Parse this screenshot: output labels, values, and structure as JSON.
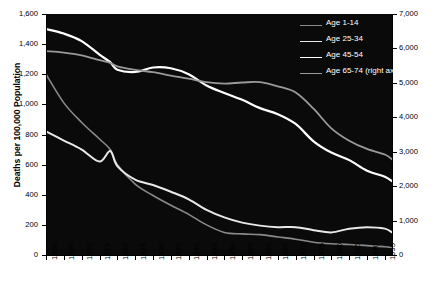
{
  "chart_data": {
    "type": "line",
    "title": "",
    "subtitle": "",
    "xlabel": "",
    "ylabel": "Deaths per 100,000 Population",
    "ylabel_right": "Deaths per 100,000 Population (age 65-74)",
    "xlim": [
      1900,
      1997
    ],
    "ylim": [
      0,
      1600
    ],
    "ylim_right": [
      0,
      7000
    ],
    "grid": false,
    "legend_position": "top-right",
    "plot_background": "#0a0a0a",
    "x_ticks": [
      "1900",
      "1905",
      "1910",
      "1915",
      "1920",
      "1925",
      "1930",
      "1935",
      "1940",
      "1945",
      "1950",
      "1955",
      "1960",
      "1965",
      "1970",
      "1975",
      "1980",
      "1985",
      "1990",
      "1995"
    ],
    "y_ticks_left": [
      "0",
      "200",
      "400",
      "600",
      "800",
      "1,000",
      "1,200",
      "1,400",
      "1,600"
    ],
    "y_ticks_right": [
      "0",
      "1,000",
      "2,000",
      "3,000",
      "4,000",
      "5,000",
      "6,000",
      "7,000"
    ],
    "x": [
      1900,
      1905,
      1910,
      1915,
      1918,
      1920,
      1925,
      1930,
      1935,
      1940,
      1945,
      1950,
      1955,
      1960,
      1965,
      1970,
      1975,
      1980,
      1985,
      1990,
      1995,
      1997
    ],
    "series": [
      {
        "name": "Age 1-14",
        "axis": "left",
        "color": "#8a8a8a",
        "width": 1.6,
        "values": [
          1200,
          1010,
          880,
          770,
          700,
          600,
          470,
          395,
          330,
          270,
          200,
          150,
          140,
          135,
          120,
          105,
          85,
          75,
          70,
          62,
          55,
          50
        ]
      },
      {
        "name": "Age 25-34",
        "axis": "left",
        "color": "#e8e8e8",
        "width": 2.0,
        "values": [
          820,
          760,
          700,
          620,
          690,
          590,
          500,
          465,
          420,
          370,
          300,
          250,
          215,
          195,
          185,
          185,
          165,
          150,
          175,
          185,
          175,
          150
        ]
      },
      {
        "name": "Age 45-54",
        "axis": "left",
        "color": "#ffffff",
        "width": 2.2,
        "values": [
          1500,
          1470,
          1420,
          1330,
          1280,
          1230,
          1215,
          1245,
          1240,
          1200,
          1125,
          1075,
          1030,
          975,
          935,
          870,
          755,
          680,
          630,
          560,
          520,
          490
        ]
      },
      {
        "name": "Age 65-74 (right axis)",
        "axis": "right",
        "color": "#9a9a9a",
        "width": 1.8,
        "values": [
          5920,
          5880,
          5800,
          5660,
          5580,
          5480,
          5380,
          5310,
          5210,
          5120,
          5020,
          4980,
          5010,
          5020,
          4900,
          4720,
          4250,
          3680,
          3320,
          3080,
          2920,
          2780
        ]
      }
    ]
  },
  "axes": {
    "left_title": "Deaths per 100,000 Population",
    "right_title": "Deaths per 100,000 Population (age 65-74)"
  },
  "legend": {
    "items": [
      {
        "label": "Age 1-14"
      },
      {
        "label": "Age 25-34"
      },
      {
        "label": "Age 45-54"
      },
      {
        "label": "Age 65-74 (right axis)"
      }
    ]
  }
}
